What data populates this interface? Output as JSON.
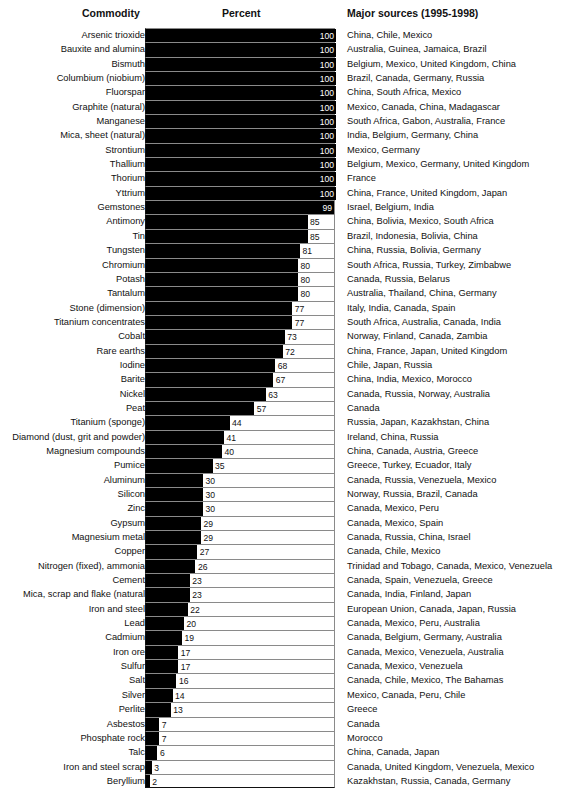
{
  "header": {
    "commodity": "Commodity",
    "percent": "Percent",
    "sources": "Major sources (1995-1998)"
  },
  "chart_data": {
    "type": "bar",
    "orientation": "horizontal",
    "title": "",
    "xlabel": "Percent",
    "ylabel": "Commodity",
    "xlim": [
      0,
      100
    ],
    "grid": false,
    "categories": [
      "Arsenic trioxide",
      "Bauxite and alumina",
      "Bismuth",
      "Columbium (niobium)",
      "Fluorspar",
      "Graphite (natural)",
      "Manganese",
      "Mica, sheet (natural)",
      "Strontium",
      "Thallium",
      "Thorium",
      "Yttrium",
      "Gemstones",
      "Antimony",
      "Tin",
      "Tungsten",
      "Chromium",
      "Potash",
      "Tantalum",
      "Stone (dimension)",
      "Titanium concentrates",
      "Cobalt",
      "Rare earths",
      "Iodine",
      "Barite",
      "Nickel",
      "Peat",
      "Titanium (sponge)",
      "Diamond (dust, grit and powder)",
      "Magnesium compounds",
      "Pumice",
      "Aluminum",
      "Silicon",
      "Zinc",
      "Gypsum",
      "Magnesium metal",
      "Copper",
      "Nitrogen (fixed), ammonia",
      "Cement",
      "Mica, scrap and flake (natural",
      "Iron and steel",
      "Lead",
      "Cadmium",
      "Iron ore",
      "Sulfur",
      "Salt",
      "Silver",
      "Perlite",
      "Asbestos",
      "Phosphate rock",
      "Talc",
      "Iron and steel scrap",
      "Beryllium"
    ],
    "values": [
      100,
      100,
      100,
      100,
      100,
      100,
      100,
      100,
      100,
      100,
      100,
      100,
      99,
      85,
      85,
      81,
      80,
      80,
      80,
      77,
      77,
      73,
      72,
      68,
      67,
      63,
      57,
      44,
      41,
      40,
      35,
      30,
      30,
      30,
      29,
      29,
      27,
      26,
      23,
      23,
      22,
      20,
      19,
      17,
      17,
      16,
      14,
      13,
      7,
      7,
      6,
      3,
      2
    ],
    "sources": [
      "China, Chile, Mexico",
      "Australia, Guinea, Jamaica, Brazil",
      "Belgium, Mexico, United Kingdom, China",
      "Brazil, Canada, Germany, Russia",
      "China, South Africa, Mexico",
      "Mexico, Canada, China, Madagascar",
      "South Africa, Gabon, Australia, France",
      "India, Belgium, Germany, China",
      "Mexico, Germany",
      "Belgium, Mexico, Germany, United Kingdom",
      "France",
      "China, France, United Kingdom, Japan",
      "Israel, Belgium, India",
      "China, Bolivia, Mexico, South Africa",
      "Brazil, Indonesia, Bolivia, China",
      "China, Russia, Bolivia, Germany",
      "South Africa, Russia, Turkey, Zimbabwe",
      "Canada, Russia, Belarus",
      "Australia, Thailand, China, Germany",
      "Italy, India, Canada, Spain",
      "South Africa, Australia, Canada, India",
      "Norway, Finland, Canada, Zambia",
      "China, France, Japan, United Kingdom",
      "Chile, Japan, Russia",
      "China, India, Mexico, Morocco",
      "Canada, Russia, Norway, Australia",
      "Canada",
      "Russia, Japan, Kazakhstan, China",
      "Ireland, China, Russia",
      "China, Canada, Austria, Greece",
      "Greece, Turkey, Ecuador, Italy",
      "Canada, Russia, Venezuela, Mexico",
      "Norway, Russia, Brazil,  Canada",
      "Canada, Mexico, Peru",
      "Canada, Mexico, Spain",
      "Canada, Russia, China, Israel",
      "Canada, Chile, Mexico",
      "Trinidad and Tobago, Canada, Mexico, Venezuela",
      "Canada, Spain, Venezuela, Greece",
      "Canada, India, Finland, Japan",
      "European Union, Canada, Japan, Russia",
      "Canada, Mexico, Peru, Australia",
      "Canada, Belgium, Germany, Australia",
      "Canada, Mexico, Venezuela, Australia",
      "Canada, Mexico, Venezuela",
      "Canada, Chile, Mexico, The Bahamas",
      "Mexico, Canada, Peru, Chile",
      "Greece",
      "Canada",
      "Morocco",
      "China, Canada, Japan",
      "Canada, United Kingdom, Venezuela, Mexico",
      "Kazakhstan, Russia, Canada, Germany"
    ]
  },
  "colors": {
    "bar": "#000000",
    "grid_line": "#8a8a8a",
    "axis": "#111111",
    "text": "#111111",
    "value_inside": "#ffffff"
  }
}
